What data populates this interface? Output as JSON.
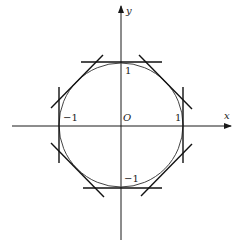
{
  "diagram": {
    "type": "unit-circle-with-circumscribed-octagon-tangents",
    "circle": {
      "center": [
        121,
        125
      ],
      "radius": 62,
      "stroke": "#444444"
    },
    "axes": {
      "color": "#1a1a1a",
      "x_axis": {
        "from": [
          12,
          126
        ],
        "to": [
          231,
          126
        ],
        "label": "x"
      },
      "y_axis": {
        "from": [
          121,
          240
        ],
        "to": [
          121,
          6
        ],
        "label": "y"
      }
    },
    "labels": {
      "origin": "O",
      "x_pos_one": "1",
      "x_neg_one": "−1",
      "y_pos_one": "1",
      "y_neg_one": "−1",
      "x_axis_name": "x",
      "y_axis_name": "y"
    },
    "tangent_lines": [
      {
        "name": "top",
        "x1": 81,
        "y1": 62,
        "x2": 162,
        "y2": 62
      },
      {
        "name": "bottom",
        "x1": 83,
        "y1": 188,
        "x2": 162,
        "y2": 188
      },
      {
        "name": "left",
        "x1": 59,
        "y1": 87,
        "x2": 59,
        "y2": 163
      },
      {
        "name": "right",
        "x1": 183,
        "y1": 87,
        "x2": 183,
        "y2": 163
      },
      {
        "name": "upper-left",
        "x1": 51,
        "y1": 108,
        "x2": 103,
        "y2": 55
      },
      {
        "name": "upper-right",
        "x1": 139,
        "y1": 55,
        "x2": 192,
        "y2": 109
      },
      {
        "name": "lower-left",
        "x1": 51,
        "y1": 143,
        "x2": 104,
        "y2": 197
      },
      {
        "name": "lower-right",
        "x1": 141,
        "y1": 196,
        "x2": 192,
        "y2": 144
      }
    ],
    "line_color": "#111111"
  }
}
